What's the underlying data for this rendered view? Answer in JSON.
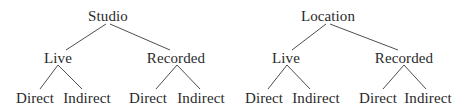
{
  "trees": [
    {
      "root": {
        "label": "Studio",
        "x": 108,
        "y": 8
      },
      "children": [
        {
          "label": "Live",
          "x": 58,
          "y": 50,
          "children": [
            {
              "label": "Direct",
              "x": 35,
              "y": 90
            },
            {
              "label": "Indirect",
              "x": 87,
              "y": 90
            }
          ]
        },
        {
          "label": "Recorded",
          "x": 176,
          "y": 50,
          "children": [
            {
              "label": "Direct",
              "x": 148,
              "y": 90
            },
            {
              "label": "Indirect",
              "x": 201,
              "y": 90
            }
          ]
        }
      ]
    },
    {
      "root": {
        "label": "Location",
        "x": 328,
        "y": 8
      },
      "children": [
        {
          "label": "Live",
          "x": 286,
          "y": 50,
          "children": [
            {
              "label": "Direct",
              "x": 264,
              "y": 90
            },
            {
              "label": "Indirect",
              "x": 316,
              "y": 90
            }
          ]
        },
        {
          "label": "Recorded",
          "x": 404,
          "y": 50,
          "children": [
            {
              "label": "Direct",
              "x": 378,
              "y": 90
            },
            {
              "label": "Indirect",
              "x": 428,
              "y": 90
            }
          ]
        }
      ]
    }
  ],
  "colors": {
    "text": "#2a2a2a",
    "edge": "#3a3a3a",
    "background": "#ffffff"
  }
}
